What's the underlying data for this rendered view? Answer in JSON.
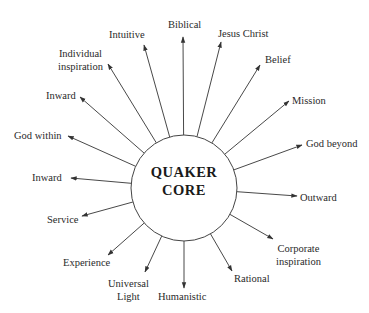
{
  "diagram": {
    "center_label": [
      "QUAKER",
      "CORE"
    ],
    "center": {
      "x": 184,
      "y": 188,
      "r": 53
    },
    "line_color": "#333333",
    "nodes": [
      {
        "label": "Biblical",
        "lines": [
          "Biblical"
        ],
        "from": [
          183,
          135
        ],
        "to": [
          183,
          37
        ],
        "lx": 168,
        "ly": 18,
        "align": "left"
      },
      {
        "label": "Jesus Christ",
        "lines": [
          "Jesus Christ"
        ],
        "from": [
          202,
          138
        ],
        "to": [
          221,
          42
        ],
        "lx": 218,
        "ly": 27,
        "align": "left"
      },
      {
        "label": "Belief",
        "lines": [
          "Belief"
        ],
        "from": [
          221,
          146
        ],
        "to": [
          260,
          65
        ],
        "lx": 265,
        "ly": 53,
        "align": "left"
      },
      {
        "label": "Mission",
        "lines": [
          "Mission"
        ],
        "from": [
          233,
          163
        ],
        "to": [
          289,
          101
        ],
        "lx": 292,
        "ly": 94,
        "align": "left"
      },
      {
        "label": "God beyond",
        "lines": [
          "God beyond"
        ],
        "from": [
          236,
          188
        ],
        "to": [
          302,
          145
        ],
        "lx": 306,
        "ly": 137,
        "align": "left"
      },
      {
        "label": "Outward",
        "lines": [
          "Outward"
        ],
        "from": [
          231,
          173
        ],
        "to": [
          297,
          196
        ],
        "lx": 300,
        "ly": 191,
        "align": "left"
      },
      {
        "label": "Corporate inspiration",
        "lines": [
          "Corporate",
          "inspiration"
        ],
        "from": [
          217,
          188
        ],
        "to": [
          273,
          239
        ],
        "lx": 276,
        "ly": 242,
        "align": "center"
      },
      {
        "label": "Rational",
        "lines": [
          "Rational"
        ],
        "from": [
          202,
          198
        ],
        "to": [
          232,
          271
        ],
        "lx": 234,
        "ly": 272,
        "align": "left"
      },
      {
        "label": "Humanistic",
        "lines": [
          "Humanistic"
        ],
        "from": [
          184,
          201
        ],
        "to": [
          184,
          288
        ],
        "lx": 158,
        "ly": 290,
        "align": "left"
      },
      {
        "label": "Universal Light",
        "lines": [
          "Universal",
          "Light"
        ],
        "from": [
          169,
          198
        ],
        "to": [
          145,
          272
        ],
        "lx": 108,
        "ly": 277,
        "align": "center"
      },
      {
        "label": "Experience",
        "lines": [
          "Experience"
        ],
        "from": [
          154,
          193
        ],
        "to": [
          108,
          255
        ],
        "lx": 63,
        "ly": 256,
        "align": "left"
      },
      {
        "label": "Service",
        "lines": [
          "Service"
        ],
        "from": [
          143,
          184
        ],
        "to": [
          82,
          216
        ],
        "lx": 47,
        "ly": 213,
        "align": "left"
      },
      {
        "label": "Inward (lower)",
        "lines": [
          "Inward"
        ],
        "from": [
          136,
          167
        ],
        "to": [
          71,
          178
        ],
        "lx": 32,
        "ly": 171,
        "align": "left"
      },
      {
        "label": "God within",
        "lines": [
          "God within"
        ],
        "from": [
          133,
          148
        ],
        "to": [
          68,
          136
        ],
        "lx": 14,
        "ly": 129,
        "align": "left"
      },
      {
        "label": "Inward (upper)",
        "lines": [
          "Inward"
        ],
        "from": [
          137,
          126
        ],
        "to": [
          80,
          97
        ],
        "lx": 46,
        "ly": 89,
        "align": "left"
      },
      {
        "label": "Individual inspiration",
        "lines": [
          "Individual",
          "inspiration"
        ],
        "from": [
          148,
          110
        ],
        "to": [
          108,
          64
        ],
        "lx": 58,
        "ly": 47,
        "align": "center"
      },
      {
        "label": "Intuitive",
        "lines": [
          "Intuitive"
        ],
        "from": [
          163,
          100
        ],
        "to": [
          144,
          45
        ],
        "lx": 109,
        "ly": 28,
        "align": "left"
      }
    ]
  }
}
